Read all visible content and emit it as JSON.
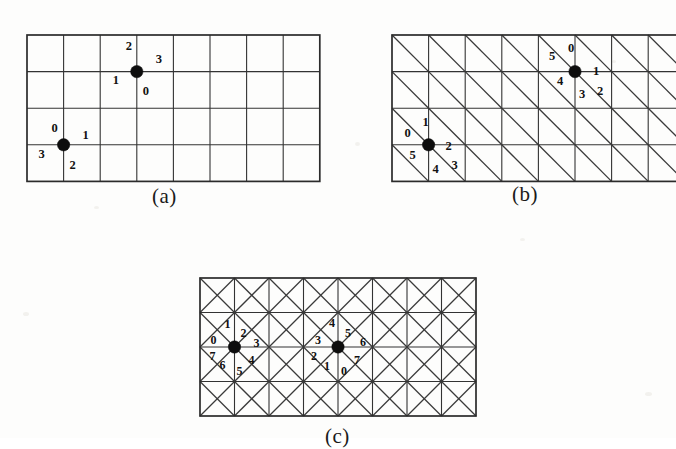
{
  "figure": {
    "background_color": "#fdfdfc",
    "line_color": "#333333",
    "vertex_color": "#0d0d0d",
    "panels": [
      {
        "id": "a",
        "caption": "(a)",
        "lattice": "square-4-connectivity",
        "columns": 8,
        "rows": 4,
        "cell_size": 36.6,
        "origin": {
          "x": 27,
          "y": 35
        },
        "vertices": [
          {
            "name": "lower-left-vertex",
            "col": 1,
            "row": 3,
            "labels": [
              {
                "value": "0",
                "dx": -9,
                "dy": -16
              },
              {
                "value": "1",
                "dx": 22,
                "dy": -9
              },
              {
                "value": "2",
                "dx": 9,
                "dy": 21
              },
              {
                "value": "3",
                "dx": -22,
                "dy": 10
              }
            ]
          },
          {
            "name": "upper-right-vertex",
            "col": 3,
            "row": 1,
            "labels": [
              {
                "value": "2",
                "dx": -8,
                "dy": -24
              },
              {
                "value": "3",
                "dx": 22,
                "dy": -11
              },
              {
                "value": "0",
                "dx": 9,
                "dy": 21
              },
              {
                "value": "1",
                "dx": -21,
                "dy": 10
              }
            ]
          }
        ]
      },
      {
        "id": "b",
        "caption": "(b)",
        "lattice": "triangular-6-connectivity",
        "columns": 8,
        "rows": 4,
        "cell_size": 36.6,
        "origin": {
          "x": 392,
          "y": 35
        },
        "diagonal": "top-left-to-bottom-right",
        "vertices": [
          {
            "name": "lower-left-vertex",
            "col": 1,
            "row": 3,
            "labels": [
              {
                "value": "0",
                "dx": -21,
                "dy": -11
              },
              {
                "value": "1",
                "dx": -3,
                "dy": -22
              },
              {
                "value": "2",
                "dx": 20,
                "dy": 2
              },
              {
                "value": "3",
                "dx": 26,
                "dy": 21
              },
              {
                "value": "4",
                "dx": 7,
                "dy": 25
              },
              {
                "value": "5",
                "dx": -16,
                "dy": 11
              }
            ]
          },
          {
            "name": "upper-right-vertex",
            "col": 5,
            "row": 1,
            "labels": [
              {
                "value": "5",
                "dx": -23,
                "dy": -14
              },
              {
                "value": "0",
                "dx": -4,
                "dy": -22
              },
              {
                "value": "1",
                "dx": 21,
                "dy": 1
              },
              {
                "value": "2",
                "dx": 25,
                "dy": 21
              },
              {
                "value": "3",
                "dx": 7,
                "dy": 24
              },
              {
                "value": "4",
                "dx": -15,
                "dy": 11
              }
            ]
          }
        ]
      },
      {
        "id": "c",
        "caption": "(c)",
        "lattice": "square-8-connectivity",
        "columns": 8,
        "rows": 4,
        "cell_size": 34.5,
        "origin": {
          "x": 200,
          "y": 278
        },
        "diagonal": "both",
        "vertices": [
          {
            "name": "left-vertex",
            "col": 1,
            "row": 2,
            "labels": [
              {
                "value": "0",
                "dx": -21,
                "dy": -6
              },
              {
                "value": "1",
                "dx": -7,
                "dy": -22
              },
              {
                "value": "2",
                "dx": 9,
                "dy": -13
              },
              {
                "value": "3",
                "dx": 22,
                "dy": -3
              },
              {
                "value": "4",
                "dx": 17,
                "dy": 14
              },
              {
                "value": "5",
                "dx": 5,
                "dy": 25
              },
              {
                "value": "6",
                "dx": -12,
                "dy": 19
              },
              {
                "value": "7",
                "dx": -22,
                "dy": 10
              }
            ]
          },
          {
            "name": "right-vertex",
            "col": 4,
            "row": 2,
            "labels": [
              {
                "value": "4",
                "dx": -6,
                "dy": -23
              },
              {
                "value": "5",
                "dx": 10,
                "dy": -13
              },
              {
                "value": "6",
                "dx": 25,
                "dy": -4
              },
              {
                "value": "7",
                "dx": 19,
                "dy": 14
              },
              {
                "value": "0",
                "dx": 6,
                "dy": 25
              },
              {
                "value": "1",
                "dx": -11,
                "dy": 20
              },
              {
                "value": "2",
                "dx": -24,
                "dy": 10
              },
              {
                "value": "3",
                "dx": -20,
                "dy": -6
              }
            ]
          }
        ]
      }
    ],
    "captions": [
      {
        "id": "caption-a",
        "text": "(a)",
        "x": 152,
        "y": 184
      },
      {
        "id": "caption-b",
        "text": "(b)",
        "x": 512,
        "y": 182
      },
      {
        "id": "caption-c",
        "text": "(c)",
        "x": 325,
        "y": 424
      }
    ]
  }
}
